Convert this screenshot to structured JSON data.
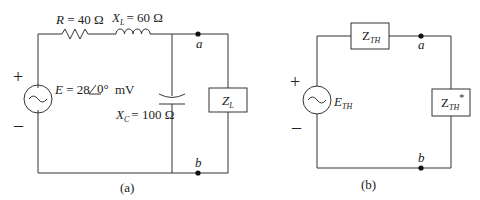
{
  "circuit_a": {
    "caption": "(a)",
    "resistor": {
      "symbol": "R",
      "value": "= 40 Ω"
    },
    "inductor": {
      "symbol": "X",
      "sub": "L",
      "value": "= 60 Ω"
    },
    "capacitor": {
      "symbol": "X",
      "sub": "C",
      "value": "= 100 Ω"
    },
    "source": {
      "symbol": "E",
      "value_pre": "= 28",
      "angle": "0°",
      "unit": "mV"
    },
    "load": {
      "symbol": "Z",
      "sub": "L"
    },
    "node_a": "a",
    "node_b": "b",
    "plus": "+",
    "minus": "–"
  },
  "circuit_b": {
    "caption": "(b)",
    "series_impedance": {
      "symbol": "Z",
      "sub": "TH"
    },
    "source": {
      "symbol": "E",
      "sub": "TH"
    },
    "load": {
      "symbol": "Z",
      "sub": "TH",
      "sup": "*"
    },
    "node_a": "a",
    "node_b": "b",
    "plus": "+",
    "minus": "–"
  }
}
